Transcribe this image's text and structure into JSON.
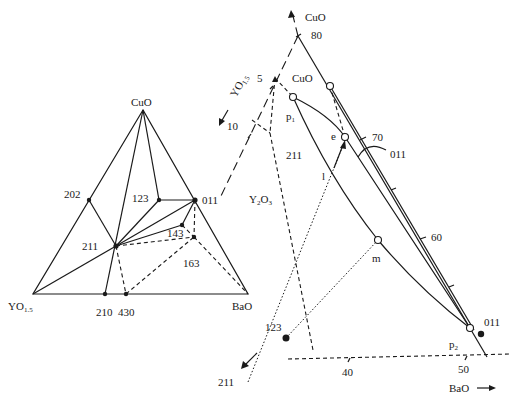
{
  "left_diagram": {
    "vertices": {
      "top": "CuO",
      "left": "YO",
      "left_sub": "1.5",
      "right": "BaO"
    },
    "phases": {
      "p202": "202",
      "p123": "123",
      "p011": "011",
      "p211": "211",
      "p143": "143",
      "p163": "163",
      "p210": "210",
      "p430": "430"
    }
  },
  "right_diagram": {
    "axes": {
      "cuo_arrow": "CuO",
      "yo_arrow": "YO",
      "yo_sub": "1.5",
      "bao_arrow": "BaO",
      "arrow_211": "211"
    },
    "ticks": {
      "cuo_80": "80",
      "cuo_70": "70",
      "cuo_60": "60",
      "yo_5": "5",
      "yo_10": "10",
      "bao_40": "40",
      "bao_50": "50"
    },
    "regions": {
      "cuo_field": "CuO",
      "field_211": "211",
      "y2o3": "Y",
      "y2o3_sub1": "2",
      "y2o3_mid": "O",
      "y2o3_sub2": "3",
      "field_011": "011"
    },
    "points": {
      "p1": "p",
      "p1_sub": "1",
      "p2": "p",
      "p2_sub": "2",
      "e": "e",
      "l": "l",
      "m": "m",
      "pt_123": "123",
      "pt_011": "011"
    }
  },
  "colors": {
    "ink": "#1a1a1a",
    "background": "#ffffff"
  }
}
